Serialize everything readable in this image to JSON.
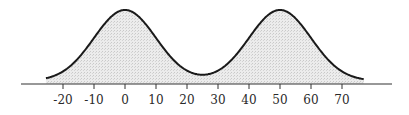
{
  "chart_data": {
    "type": "area",
    "title": "",
    "xlabel": "",
    "ylabel": "",
    "series": [
      {
        "name": "density",
        "components": [
          {
            "mean": 0,
            "sd": 10,
            "weight": 0.5
          },
          {
            "mean": 50,
            "sd": 10,
            "weight": 0.5
          }
        ]
      }
    ],
    "x_range": [
      -25.5,
      77
    ],
    "xlim": [
      -33,
      87
    ],
    "xticks": [
      -20,
      -10,
      0,
      10,
      20,
      30,
      40,
      50,
      60,
      70
    ],
    "xtick_labels": [
      "-20",
      "-10",
      "0",
      "10",
      "20",
      "30",
      "40",
      "50",
      "60",
      "70"
    ],
    "grid": false,
    "legend": "none",
    "fill_color": "#e3e3e3",
    "line_color": "#1a1a1a"
  }
}
